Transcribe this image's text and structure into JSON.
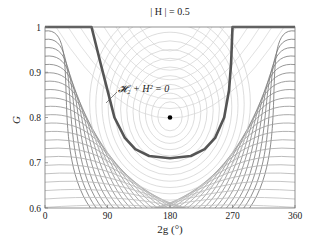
{
  "chart_data": {
    "type": "line",
    "subtype": "contour",
    "title": "",
    "xlabel": "2g (°)",
    "ylabel": "G",
    "xlim": [
      0,
      360
    ],
    "ylim": [
      0.6,
      1.0
    ],
    "xticks": [
      0,
      90,
      180,
      270,
      360
    ],
    "xtick_labels": [
      "0",
      "90",
      "180",
      "270",
      "360"
    ],
    "yticks": [
      0.6,
      0.7,
      0.8,
      0.9,
      1.0
    ],
    "ytick_labels": [
      "0.6",
      "0.7",
      "0.8",
      "0.9",
      "1"
    ],
    "grid": false,
    "legend": null,
    "annotations": [
      {
        "text": "| H | = 0.5",
        "position": "top-center",
        "x": 180,
        "y": 1.0
      },
      {
        "text": "𝓗₂ + H² = 0",
        "x": 115,
        "y": 0.88,
        "arrow_to": {
          "x": 100,
          "y": 0.82
        }
      }
    ],
    "separatrix": {
      "label": "𝓗₂ + H² = 0",
      "color": "#555555",
      "linewidth": 2.5,
      "points": [
        [
          0,
          1.0
        ],
        [
          67,
          1.0
        ],
        [
          80,
          0.92
        ],
        [
          90,
          0.86
        ],
        [
          100,
          0.8
        ],
        [
          115,
          0.755
        ],
        [
          130,
          0.73
        ],
        [
          150,
          0.715
        ],
        [
          180,
          0.71
        ],
        [
          210,
          0.715
        ],
        [
          230,
          0.73
        ],
        [
          245,
          0.755
        ],
        [
          258,
          0.8
        ],
        [
          265,
          0.86
        ],
        [
          268,
          0.92
        ],
        [
          270,
          1.0
        ],
        [
          360,
          1.0
        ]
      ]
    },
    "equilibrium_point": {
      "x": 180,
      "y": 0.8,
      "marker": "dot",
      "color": "#000000"
    },
    "contour_colors": {
      "outer": "#6e6e6e",
      "inner": "#c8c8c8"
    }
  }
}
